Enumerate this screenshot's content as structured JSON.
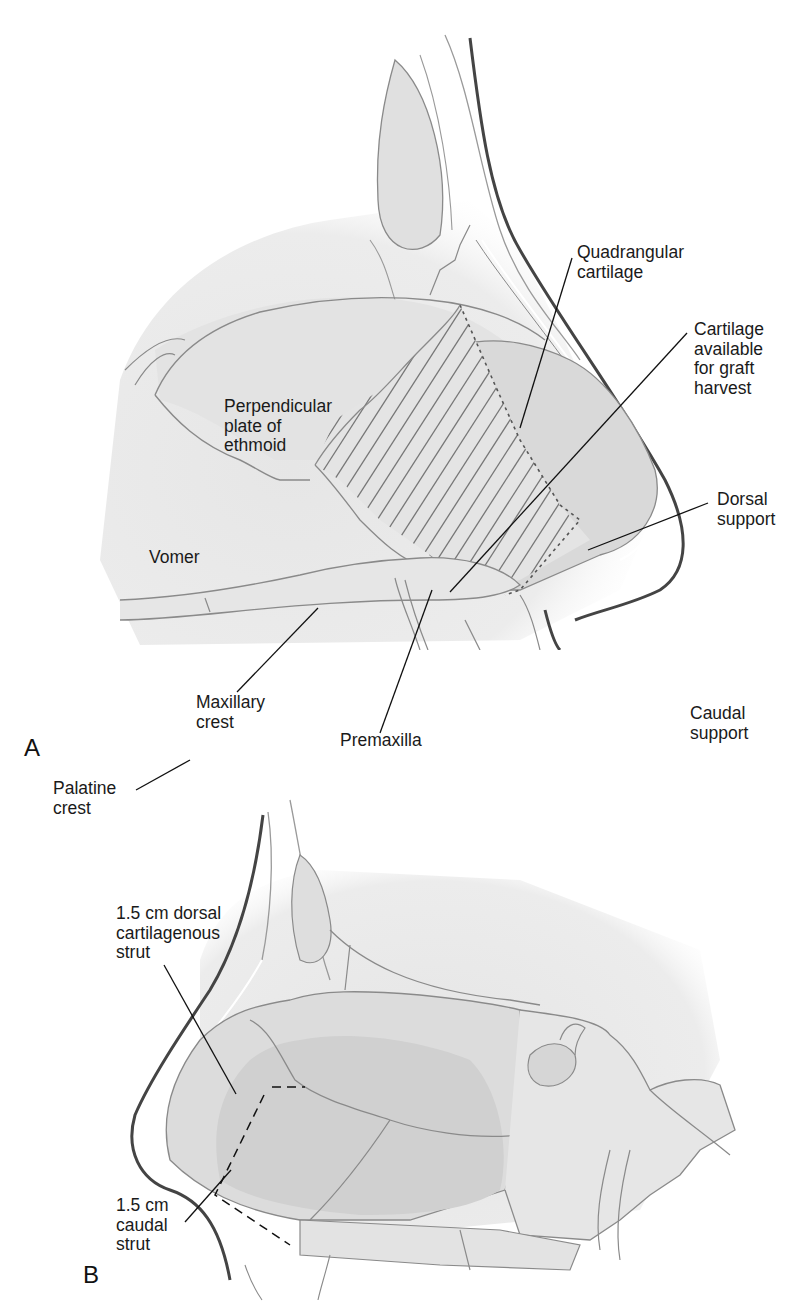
{
  "figure": {
    "panels": [
      {
        "id": "A",
        "letter": "A",
        "labels": {
          "quadrangular_cartilage": "Quadrangular\ncartilage",
          "cartilage_available": "Cartilage\navailable\nfor graft\nharvest",
          "perpendicular_plate": "Perpendicular\nplate of\nethmoid",
          "vomer": "Vomer",
          "dorsal_support": "Dorsal\nsupport",
          "caudal_support": "Caudal\nsupport",
          "palatine_crest": "Palatine\ncrest",
          "maxillary_crest": "Maxillary\ncrest",
          "premaxilla": "Premaxilla"
        }
      },
      {
        "id": "B",
        "letter": "B",
        "labels": {
          "dorsal_strut": "1.5 cm dorsal\ncartilagenous\nstrut",
          "caudal_strut": "1.5 cm\ncaudal\nstrut"
        }
      }
    ]
  },
  "colors": {
    "bone_fill": "#e9e9e9",
    "cartilage_fill": "#dcdcdc",
    "dark_region": "#cfcfcf",
    "outline": "#8a8a8a",
    "skin_line": "#3a3a3a",
    "leader": "#111111"
  }
}
